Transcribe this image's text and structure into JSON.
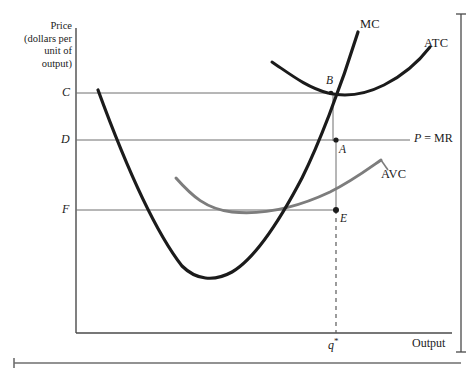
{
  "figure": {
    "axis_caption_lines": [
      "Price",
      "(dollars per",
      "unit of",
      "output)"
    ],
    "y_axis_ticks": [
      {
        "label": "C",
        "y": 93
      },
      {
        "label": "D",
        "y": 140
      },
      {
        "label": "F",
        "y": 210
      }
    ],
    "x_axis_title": "Output",
    "x_axis_tick": "q*",
    "curves": [
      {
        "name": "MC",
        "label": "MC",
        "color": "#1b1b1b"
      },
      {
        "name": "ATC",
        "label": "ATC",
        "color": "#1b1b1b"
      },
      {
        "name": "AVC",
        "label": "AVC",
        "color": "#7d7d7d"
      }
    ],
    "points": [
      {
        "label": "A",
        "x": 337,
        "y": 140
      },
      {
        "label": "B",
        "x": 330,
        "y": 93
      },
      {
        "label": "E",
        "x": 335,
        "y": 210
      }
    ],
    "price_line_label": "P = MR",
    "colors": {
      "curve_dark": "#1b1b1b",
      "curve_gray": "#7d7d7d",
      "axis": "#4a4a4a",
      "guide_line": "#6e6e6e",
      "background": "#ffffff"
    }
  }
}
